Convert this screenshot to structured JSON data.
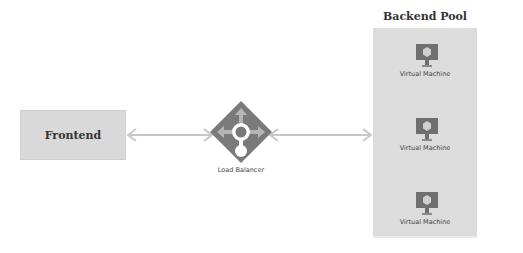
{
  "diagram": {
    "nodes": {
      "frontend": {
        "label": "Frontend"
      },
      "load_balancer": {
        "label": "Load Balancer",
        "icon": "load-balancer-icon"
      },
      "backend_pool": {
        "title": "Backend Pool",
        "members": [
          {
            "label": "Virtual Machine",
            "icon": "virtual-machine-icon"
          },
          {
            "label": "Virtual Machine",
            "icon": "virtual-machine-icon"
          },
          {
            "label": "Virtual Machine",
            "icon": "virtual-machine-icon"
          }
        ]
      }
    },
    "edges": [
      {
        "from": "Frontend",
        "to": "Load Balancer",
        "direction": "bidirectional"
      },
      {
        "from": "Load Balancer",
        "to": "Backend Pool",
        "direction": "bidirectional"
      }
    ],
    "colors": {
      "box_fill": "#d9d9d9",
      "pool_fill": "#dcdcdc",
      "arrow": "#c8c8c8",
      "icon_dark": "#6f6f6f",
      "icon_light": "#bdbdbd"
    }
  }
}
